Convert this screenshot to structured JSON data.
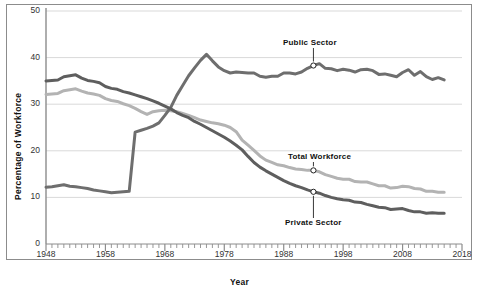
{
  "chart_data": {
    "type": "line",
    "title": "",
    "xlabel": "Year",
    "ylabel": "Percentage of Workforce",
    "xlim": [
      1948,
      2018
    ],
    "ylim": [
      0,
      50
    ],
    "grid": true,
    "legend_position": "inline-annotations",
    "y_ticks": [
      0,
      10,
      20,
      30,
      40,
      50
    ],
    "x_ticks": [
      1948,
      1958,
      1968,
      1978,
      1988,
      1998,
      2008,
      2018
    ],
    "x_minor_tick_interval": 1,
    "colors": {
      "public_sector": "#6e6e6e",
      "total_workforce": "#b3b3b3",
      "private_sector": "#5e5e5e",
      "gridline": "#d9d9d9",
      "axis": "#8c8c8c",
      "text": "#111111"
    },
    "annotations": [
      {
        "label": "Public Sector",
        "series": "Public Sector",
        "year": 1993,
        "value": 38.3,
        "text_x": 283,
        "text_y": 38
      },
      {
        "label": "Total Workforce",
        "series": "Total Workforce",
        "year": 1993,
        "value": 15.8,
        "text_x": 288,
        "text_y": 152
      },
      {
        "label": "Private Sector",
        "series": "Private Sector",
        "year": 1993,
        "value": 11.2,
        "text_x": 285,
        "text_y": 218
      }
    ],
    "series": [
      {
        "name": "Private Sector",
        "color": "#5e5e5e",
        "x": [
          1948,
          1949,
          1950,
          1951,
          1952,
          1953,
          1954,
          1955,
          1956,
          1957,
          1958,
          1959,
          1960,
          1961,
          1962,
          1963,
          1964,
          1965,
          1966,
          1967,
          1968,
          1969,
          1970,
          1971,
          1972,
          1973,
          1974,
          1975,
          1976,
          1977,
          1978,
          1979,
          1980,
          1981,
          1982,
          1983,
          1984,
          1985,
          1986,
          1987,
          1988,
          1989,
          1990,
          1991,
          1992,
          1993,
          1994,
          1995,
          1996,
          1997,
          1998,
          1999,
          2000,
          2001,
          2002,
          2003,
          2004,
          2005,
          2006,
          2007,
          2008,
          2009,
          2010,
          2011,
          2012,
          2013,
          2014,
          2015
        ],
        "y": [
          35.0,
          35.1,
          35.2,
          35.9,
          36.1,
          36.3,
          35.6,
          35.1,
          34.9,
          34.6,
          33.8,
          33.4,
          33.2,
          32.7,
          32.4,
          32.0,
          31.6,
          31.2,
          30.7,
          30.2,
          29.6,
          29.0,
          28.2,
          27.6,
          27.1,
          26.3,
          25.7,
          25.0,
          24.3,
          23.6,
          22.9,
          22.1,
          21.2,
          20.2,
          18.8,
          17.5,
          16.5,
          15.7,
          15.0,
          14.3,
          13.6,
          13.0,
          12.5,
          12.1,
          11.6,
          11.2,
          10.9,
          10.4,
          10.0,
          9.7,
          9.5,
          9.4,
          9.0,
          8.9,
          8.5,
          8.2,
          7.9,
          7.8,
          7.4,
          7.5,
          7.6,
          7.2,
          6.9,
          6.9,
          6.6,
          6.7,
          6.6,
          6.6
        ]
      },
      {
        "name": "Total Workforce",
        "color": "#b3b3b3",
        "x": [
          1948,
          1949,
          1950,
          1951,
          1952,
          1953,
          1954,
          1955,
          1956,
          1957,
          1958,
          1959,
          1960,
          1961,
          1962,
          1963,
          1964,
          1965,
          1966,
          1967,
          1968,
          1969,
          1970,
          1971,
          1972,
          1973,
          1974,
          1975,
          1976,
          1977,
          1978,
          1979,
          1980,
          1981,
          1982,
          1983,
          1984,
          1985,
          1986,
          1987,
          1988,
          1989,
          1990,
          1991,
          1992,
          1993,
          1994,
          1995,
          1996,
          1997,
          1998,
          1999,
          2000,
          2001,
          2002,
          2003,
          2004,
          2005,
          2006,
          2007,
          2008,
          2009,
          2010,
          2011,
          2012,
          2013,
          2014,
          2015
        ],
        "y": [
          32.1,
          32.2,
          32.3,
          32.9,
          33.1,
          33.3,
          32.8,
          32.4,
          32.2,
          31.9,
          31.2,
          30.8,
          30.6,
          30.1,
          29.7,
          29.1,
          28.4,
          27.8,
          28.4,
          28.6,
          28.7,
          28.6,
          28.4,
          28.0,
          27.6,
          27.1,
          26.6,
          26.3,
          26.0,
          25.8,
          25.5,
          25.0,
          24.1,
          22.3,
          21.2,
          20.1,
          18.9,
          18.0,
          17.5,
          17.0,
          16.8,
          16.4,
          16.1,
          16.0,
          15.8,
          15.8,
          15.5,
          14.9,
          14.5,
          14.1,
          13.9,
          13.9,
          13.4,
          13.3,
          13.3,
          12.9,
          12.5,
          12.5,
          12.0,
          12.1,
          12.4,
          12.3,
          11.9,
          11.8,
          11.3,
          11.3,
          11.1,
          11.1
        ]
      },
      {
        "name": "Public Sector",
        "color": "#6e6e6e",
        "x": [
          1948,
          1949,
          1950,
          1951,
          1952,
          1953,
          1954,
          1955,
          1956,
          1957,
          1958,
          1959,
          1960,
          1961,
          1962,
          1963,
          1964,
          1965,
          1966,
          1967,
          1968,
          1969,
          1970,
          1971,
          1972,
          1973,
          1974,
          1975,
          1976,
          1977,
          1978,
          1979,
          1980,
          1981,
          1982,
          1983,
          1984,
          1985,
          1986,
          1987,
          1988,
          1989,
          1990,
          1991,
          1992,
          1993,
          1994,
          1995,
          1996,
          1997,
          1998,
          1999,
          2000,
          2001,
          2002,
          2003,
          2004,
          2005,
          2006,
          2007,
          2008,
          2009,
          2010,
          2011,
          2012,
          2013,
          2014,
          2015
        ],
        "y": [
          12.2,
          12.3,
          12.5,
          12.7,
          12.4,
          12.3,
          12.1,
          11.9,
          11.6,
          11.4,
          11.2,
          11.0,
          11.1,
          11.2,
          11.3,
          24.0,
          24.4,
          24.8,
          25.3,
          26.0,
          27.6,
          29.3,
          31.9,
          34.0,
          36.1,
          37.8,
          39.4,
          40.7,
          39.3,
          38.0,
          37.2,
          36.7,
          36.9,
          36.8,
          36.7,
          36.7,
          36.0,
          35.8,
          36.0,
          36.0,
          36.7,
          36.7,
          36.5,
          36.9,
          37.7,
          38.3,
          38.7,
          37.7,
          37.6,
          37.2,
          37.5,
          37.3,
          36.9,
          37.4,
          37.5,
          37.2,
          36.4,
          36.5,
          36.2,
          35.9,
          36.8,
          37.4,
          36.2,
          37.0,
          35.9,
          35.3,
          35.7,
          35.2
        ]
      }
    ]
  },
  "axis_labels": {
    "y_title": "Percentage of Workforce",
    "x_title": "Year",
    "y_ticks": [
      "0",
      "10",
      "20",
      "30",
      "40",
      "50"
    ],
    "x_ticks": [
      "1948",
      "1958",
      "1968",
      "1978",
      "1988",
      "1998",
      "2008",
      "2018"
    ]
  },
  "annotation_labels": {
    "public": "Public Sector",
    "total": "Total  Workforce",
    "private": "Private Sector"
  }
}
